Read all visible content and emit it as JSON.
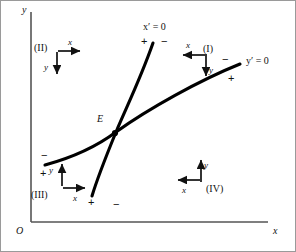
{
  "figure": {
    "kind": "phase-plane-nullcline-diagram",
    "background": "#ffffff",
    "frame_color": "#9a9a9a",
    "curve_color": "#000000",
    "axis_color": "#555555"
  },
  "axes": {
    "y_label": "y",
    "x_label": "x",
    "origin_label": "O"
  },
  "equilibrium": {
    "label": "E",
    "x": 115,
    "y": 133
  },
  "nullclines": [
    {
      "name": "x-nullcline",
      "label": "x′ = 0",
      "label_x": 143,
      "label_y": 22,
      "signs": [
        {
          "text": "+",
          "x": 141,
          "y": 36
        },
        {
          "text": "−",
          "x": 161,
          "y": 36
        },
        {
          "text": "+",
          "x": 88,
          "y": 197
        },
        {
          "text": "−",
          "x": 113,
          "y": 199
        }
      ],
      "path": "M 153,43 C 140,80 126,108 116,132 C 107,154 98,176 92,196"
    },
    {
      "name": "y-nullcline",
      "label": "y′ = 0",
      "label_x": 246,
      "label_y": 56,
      "signs": [
        {
          "text": "−",
          "x": 222,
          "y": 54
        },
        {
          "text": "+",
          "x": 228,
          "y": 73
        },
        {
          "text": "−",
          "x": 41,
          "y": 150
        },
        {
          "text": "+",
          "x": 40,
          "y": 168
        }
      ],
      "path": "M 45,165 C 78,156 100,144 116,132 C 148,109 200,80 240,64"
    }
  ],
  "regions": [
    {
      "id": "region-2",
      "label": "(II)",
      "label_x": 34,
      "label_y": 43,
      "x_arrow": {
        "dir": "right",
        "name": "x",
        "tip_x": 80,
        "tip_y": 51,
        "name_x": 68,
        "name_y": 38
      },
      "y_arrow": {
        "dir": "down",
        "name": "y",
        "tip_x": 57,
        "tip_y": 74,
        "name_x": 44,
        "name_y": 63
      }
    },
    {
      "id": "region-1",
      "label": "(I)",
      "label_x": 203,
      "label_y": 44,
      "x_arrow": {
        "dir": "left",
        "name": "x",
        "tip_x": 183,
        "tip_y": 55,
        "name_x": 186,
        "name_y": 41
      },
      "y_arrow": {
        "dir": "down",
        "name": "y",
        "tip_x": 206,
        "tip_y": 76,
        "name_x": 209,
        "name_y": 66
      }
    },
    {
      "id": "region-3",
      "label": "(III)",
      "label_x": 31,
      "label_y": 190,
      "x_arrow": {
        "dir": "right",
        "name": "x",
        "tip_x": 85,
        "tip_y": 188,
        "name_x": 73,
        "name_y": 194
      },
      "y_arrow": {
        "dir": "up",
        "name": "y",
        "tip_x": 62,
        "tip_y": 164,
        "name_x": 49,
        "name_y": 166
      }
    },
    {
      "id": "region-4",
      "label": "(IV)",
      "label_x": 206,
      "label_y": 184,
      "x_arrow": {
        "dir": "left",
        "name": "x",
        "tip_x": 178,
        "tip_y": 180,
        "name_x": 182,
        "name_y": 186
      },
      "y_arrow": {
        "dir": "up",
        "name": "y",
        "tip_x": 201,
        "tip_y": 160,
        "name_x": 204,
        "name_y": 161
      }
    }
  ]
}
